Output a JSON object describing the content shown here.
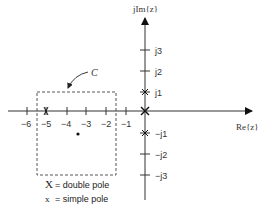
{
  "diagram": {
    "axes": {
      "vertical_label": "jIm{z}",
      "horizontal_label": "Re{z}"
    },
    "real_ticks": [
      {
        "label": "−6",
        "value": -6
      },
      {
        "label": "−5",
        "value": -5
      },
      {
        "label": "−4",
        "value": -4
      },
      {
        "label": "−3",
        "value": -3
      },
      {
        "label": "−2",
        "value": -2
      },
      {
        "label": "−1",
        "value": -1
      }
    ],
    "imag_ticks": [
      {
        "label": "j3",
        "value": 3
      },
      {
        "label": "j2",
        "value": 2
      },
      {
        "label": "j1",
        "value": 1
      },
      {
        "label": "−j1",
        "value": -1
      },
      {
        "label": "−j2",
        "value": -2
      },
      {
        "label": "−j3",
        "value": -3
      }
    ],
    "contour": {
      "label": "C",
      "style": "dashed rectangle",
      "real_range": [
        -5.5,
        -1.5
      ],
      "imag_range": [
        -3.2,
        1
      ]
    },
    "poles": [
      {
        "type": "double",
        "real": 0,
        "imag": 0,
        "symbol": "X"
      },
      {
        "type": "simple",
        "real": 0,
        "imag": 1,
        "symbol": "x"
      },
      {
        "type": "simple",
        "real": 0,
        "imag": -1,
        "symbol": "x"
      },
      {
        "type": "simple",
        "real": -5,
        "imag": 0,
        "symbol": "x"
      }
    ],
    "points": [
      {
        "type": "dot",
        "real": -3.4,
        "imag": -1.2
      }
    ],
    "legend": [
      {
        "symbol": "X",
        "text": "= double pole"
      },
      {
        "symbol": "x",
        "text": "= simple pole"
      }
    ]
  }
}
